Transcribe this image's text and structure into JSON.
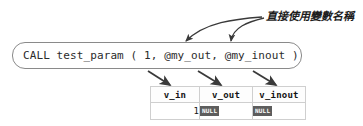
{
  "annotation": {
    "text": "直接使用變數名稱"
  },
  "statement": {
    "text": "CALL test_param ( 1, @my_out, @my_inout )"
  },
  "result_grid": {
    "columns": [
      "v_in",
      "v_out",
      "v_inout"
    ],
    "rows": [
      {
        "v_in": "1",
        "v_out": "NULL",
        "v_inout": "NULL"
      }
    ]
  },
  "colors": {
    "arrow": "#3a3a3a",
    "box_border": "#8a8a8a",
    "grid_border": "#cfcfcf",
    "null_badge_bg": "#5d5d5d",
    "text": "#2b2b2b"
  }
}
